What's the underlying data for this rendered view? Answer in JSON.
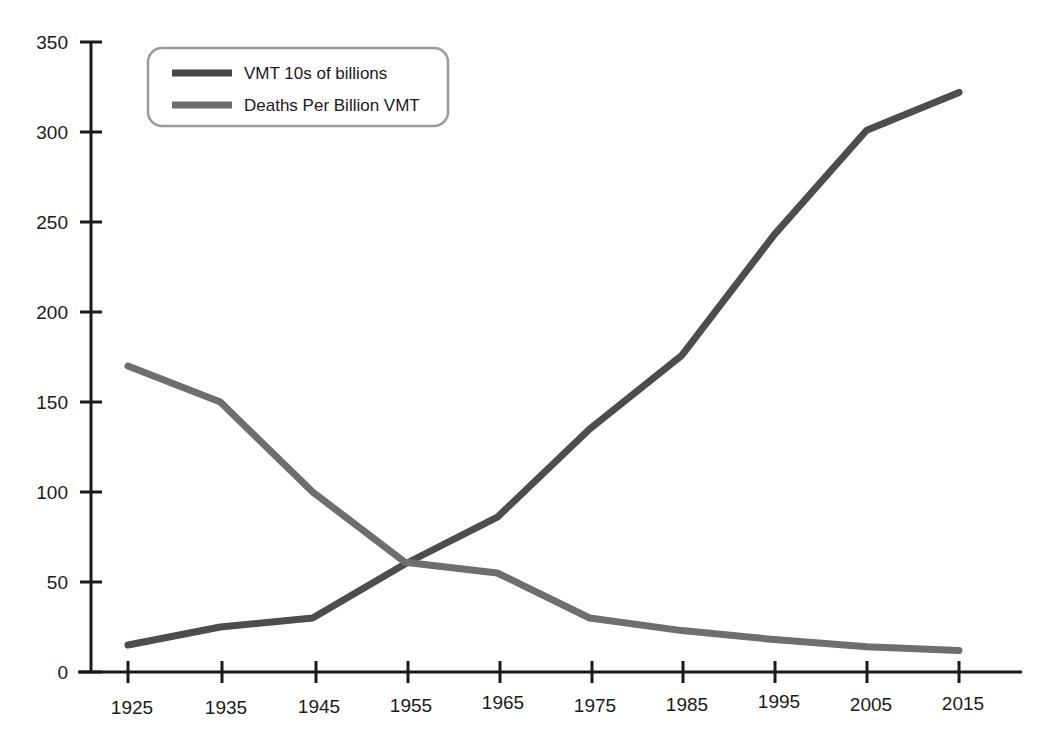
{
  "chart_data": {
    "type": "line",
    "title": "",
    "subtitle": "",
    "xlabel": "",
    "ylabel": "",
    "categories": [
      "1925",
      "1935",
      "1945",
      "1955",
      "1965",
      "1975",
      "1985",
      "1995",
      "2005",
      "2015"
    ],
    "x": [
      1925,
      1935,
      1945,
      1955,
      1965,
      1975,
      1985,
      1995,
      2005,
      2015
    ],
    "series": [
      {
        "name": "VMT 10s of billions",
        "color": "#4d4d4d",
        "values": [
          15,
          25,
          30,
          60,
          86,
          135,
          176,
          243,
          301,
          322
        ]
      },
      {
        "name": "Deaths Per Billion VMT",
        "color": "#6e6e6e",
        "values": [
          170,
          150,
          100,
          61,
          55,
          30,
          23,
          18,
          14,
          12
        ]
      }
    ],
    "ylim": [
      0,
      350
    ],
    "yticks": [
      0,
      50,
      100,
      150,
      200,
      250,
      300,
      350
    ],
    "ytick_labels": [
      "0",
      "50",
      "100",
      "150",
      "200",
      "250",
      "300",
      "350"
    ],
    "xtick_labels": [
      "1925",
      "1935",
      "1945",
      "1955",
      "1965",
      "1975",
      "1985",
      "1995",
      "2005",
      "2015"
    ],
    "grid": false,
    "legend_position": "top-left"
  },
  "legend": {
    "entries": [
      {
        "label": "VMT 10s of billions",
        "swatch_color": "#474747"
      },
      {
        "label": "Deaths Per Billion VMT",
        "swatch_color": "#6e6e6e"
      }
    ]
  },
  "axis": {
    "y_labels": [
      "350",
      "300",
      "250",
      "200",
      "150",
      "100",
      "50",
      "0"
    ],
    "x_labels": [
      "1925",
      "1935",
      "1945",
      "1955",
      "1965",
      "1975",
      "1985",
      "1995",
      "2005",
      "2015"
    ]
  },
  "colors": {
    "background": "#ffffff",
    "axis": "#1a1a1a",
    "series_1": "#474747",
    "series_2": "#6e6e6e",
    "text": "#1a1a1a",
    "legend_border": "#9a9a9a"
  }
}
